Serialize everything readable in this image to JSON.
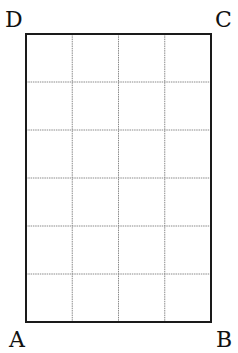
{
  "diagram": {
    "type": "rectangle-grid",
    "columns": 4,
    "rows": 6,
    "rect": {
      "x": 26,
      "y": 34,
      "width": 185,
      "height": 288
    },
    "border_color": "#1a1a1a",
    "grid_color": "#8a8a8a",
    "vertices": [
      {
        "name": "A",
        "label": "A",
        "position": "bottom-left"
      },
      {
        "name": "B",
        "label": "B",
        "position": "bottom-right"
      },
      {
        "name": "C",
        "label": "C",
        "position": "top-right"
      },
      {
        "name": "D",
        "label": "D",
        "position": "top-left"
      }
    ]
  }
}
